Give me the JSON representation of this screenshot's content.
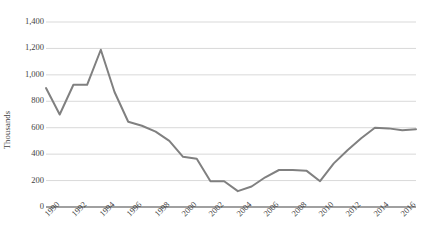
{
  "chart_data": {
    "type": "line",
    "title": "",
    "xlabel": "",
    "ylabel": "Thousands",
    "x": [
      1990,
      1991,
      1992,
      1993,
      1994,
      1995,
      1996,
      1997,
      1998,
      1999,
      2000,
      2001,
      2002,
      2003,
      2004,
      2005,
      2006,
      2007,
      2008,
      2009,
      2010,
      2011,
      2012,
      2013,
      2014,
      2015,
      2016,
      2017
    ],
    "values": [
      900,
      700,
      925,
      925,
      1190,
      870,
      645,
      615,
      570,
      500,
      380,
      365,
      195,
      195,
      120,
      155,
      225,
      280,
      280,
      275,
      195,
      330,
      430,
      520,
      600,
      595,
      580,
      588
    ],
    "series": [
      {
        "name": "Series 1",
        "values": [
          900,
          700,
          925,
          925,
          1190,
          870,
          645,
          615,
          570,
          500,
          380,
          365,
          195,
          195,
          120,
          155,
          225,
          280,
          280,
          275,
          195,
          330,
          430,
          520,
          600,
          595,
          580,
          588
        ],
        "color": "#808080"
      }
    ],
    "ylim": [
      0,
      1400
    ],
    "yticks": [
      0,
      200,
      400,
      600,
      800,
      1000,
      1200,
      1400
    ],
    "ytick_labels": [
      "0",
      "200",
      "400",
      "600",
      "800",
      "1,000",
      "1,200",
      "1,400"
    ],
    "xlim": [
      1990,
      2017
    ],
    "xticks": [
      1990,
      1992,
      1994,
      1996,
      1998,
      2000,
      2002,
      2004,
      2006,
      2008,
      2010,
      2012,
      2014,
      2016
    ],
    "xtick_labels": [
      "1990",
      "1992",
      "1994",
      "1996",
      "1998",
      "2000",
      "2002",
      "2004",
      "2006",
      "2008",
      "2010",
      "2012",
      "2014",
      "2016"
    ],
    "grid": true,
    "grid_axis": "y",
    "grid_color": "#d9d9d9",
    "axis_color": "#808080",
    "legend": false,
    "legend_position": "none"
  }
}
